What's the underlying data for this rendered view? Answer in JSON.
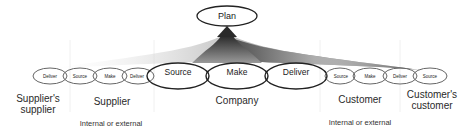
{
  "plan": {
    "label": "Plan"
  },
  "chain": {
    "suppliers_supplier": {
      "items": [
        "Deliver"
      ],
      "label": "Supplier's supplier"
    },
    "supplier": {
      "items": [
        "Source",
        "Make",
        "Deliver"
      ],
      "label": "Supplier",
      "note": "Internal or external"
    },
    "company": {
      "items": [
        "Source",
        "Make",
        "Deliver"
      ],
      "label": "Company"
    },
    "customer": {
      "items": [
        "Source",
        "Make",
        "Deliver"
      ],
      "label": "Customer",
      "note": "Internal or external"
    },
    "customers_customer": {
      "items": [
        "Source"
      ],
      "label": "Customer's customer"
    }
  },
  "colors": {
    "stroke": "#222222",
    "small_stroke": "#666666",
    "gradient_dark": "#3a3a3a",
    "gradient_light": "#ffffff"
  }
}
